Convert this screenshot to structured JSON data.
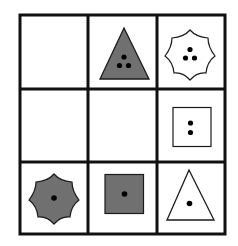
{
  "puzzle": {
    "title": "3x3 shape matrix",
    "rows": 3,
    "cols": 3,
    "colors": {
      "grid_line": "#111111",
      "shape_stroke": "#1a1a1a",
      "gray_fill": "#707070",
      "white_fill": "#ffffff",
      "dot": "#000000"
    },
    "cells": [
      {
        "row": 0,
        "col": 0,
        "shape": "empty",
        "fill": "none",
        "dots": 0
      },
      {
        "row": 0,
        "col": 1,
        "shape": "triangle",
        "fill": "gray",
        "dots": 3
      },
      {
        "row": 0,
        "col": 2,
        "shape": "heptagon",
        "fill": "white",
        "dots": 3
      },
      {
        "row": 1,
        "col": 0,
        "shape": "empty",
        "fill": "none",
        "dots": 0
      },
      {
        "row": 1,
        "col": 1,
        "shape": "empty",
        "fill": "none",
        "dots": 0
      },
      {
        "row": 1,
        "col": 2,
        "shape": "square",
        "fill": "white",
        "dots": 2
      },
      {
        "row": 2,
        "col": 0,
        "shape": "heptagon",
        "fill": "gray",
        "dots": 1
      },
      {
        "row": 2,
        "col": 1,
        "shape": "square",
        "fill": "gray",
        "dots": 1
      },
      {
        "row": 2,
        "col": 2,
        "shape": "triangle",
        "fill": "white",
        "dots": 1
      }
    ]
  }
}
